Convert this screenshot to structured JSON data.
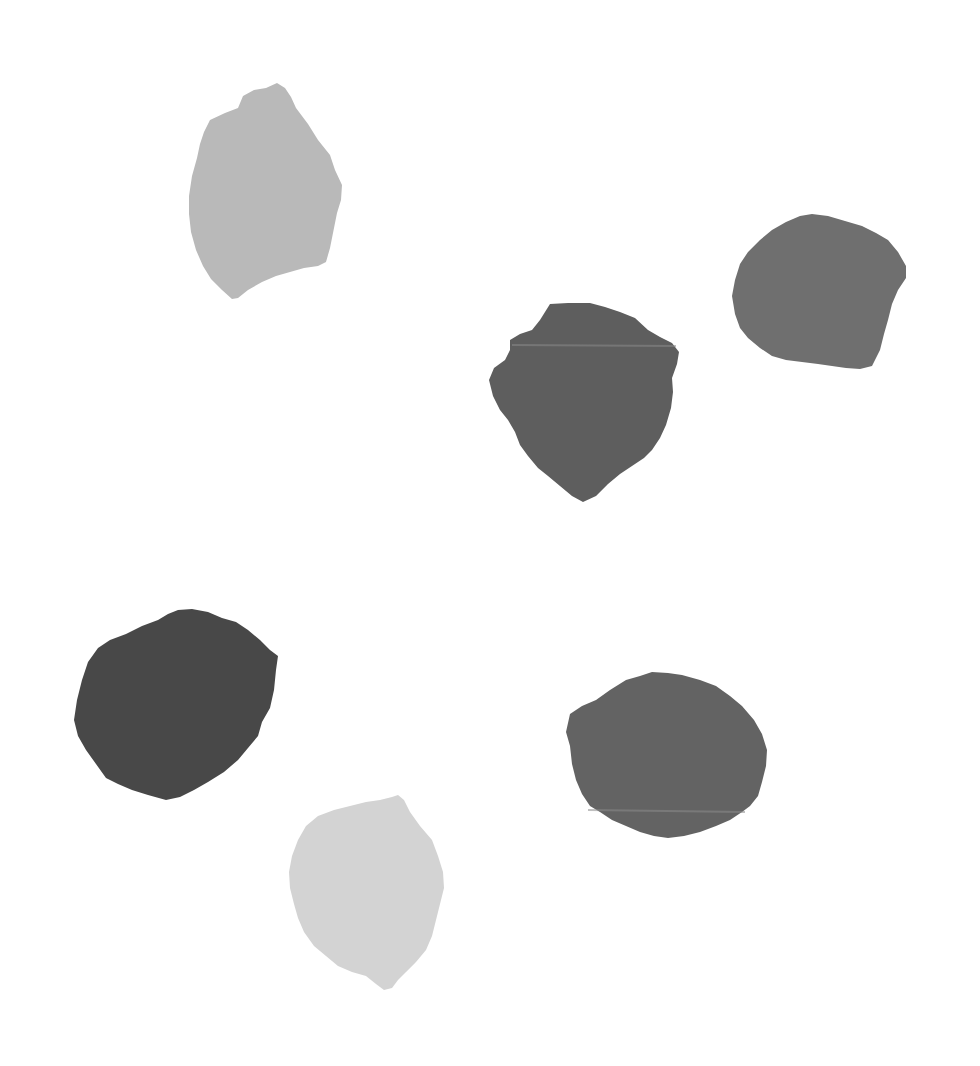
{
  "canvas": {
    "width": 980,
    "height": 1066,
    "background": "#ffffff"
  },
  "swatches": [
    {
      "id": "swatch-1",
      "tone": "light-gray",
      "color": "#b9b9b9",
      "points": "277,83 285,88 291,97 296,108 308,124 318,140 330,155 335,170 342,185 341,200 337,213 334,228 330,248 326,262 318,266 304,268 290,272 276,276 262,282 248,290 238,298 232,299 222,290 211,279 203,266 196,250 191,232 189,214 189,196 192,176 197,158 200,144 204,132 210,120 225,113 238,108 243,96 254,90 266,88"
    },
    {
      "id": "swatch-2",
      "tone": "dark-gray",
      "color": "#5e5e5e",
      "points": "550,304 568,303 590,303 605,307 620,312 635,318 648,330 660,337 672,343 679,352 677,364 672,378 673,392 671,408 666,425 660,438 652,450 644,458 632,466 620,474 608,484 596,496 583,502 572,496 560,486 548,476 538,468 528,456 520,445 515,432 508,420 500,410 493,396 489,380 494,368 505,360 510,350 510,340 520,334 532,330 540,320"
    },
    {
      "id": "swatch-3",
      "tone": "medium-gray",
      "color": "#6f6f6f",
      "points": "800,216 812,214 828,216 845,221 862,226 876,233 888,240 898,252 906,266 906,278 898,290 892,304 888,320 884,334 880,350 872,366 860,369 846,368 832,366 818,364 802,362 786,360 772,356 760,348 748,338 740,328 735,314 732,296 735,280 740,264 748,252 760,240 772,230 786,222"
    },
    {
      "id": "swatch-4",
      "tone": "charcoal",
      "color": "#484848",
      "points": "178,610 192,609 208,612 222,618 236,622 248,630 260,640 270,650 278,656 276,670 274,690 270,708 262,722 258,736 248,748 238,760 224,772 208,782 194,790 180,797 166,800 148,795 132,790 118,784 106,778 96,764 86,750 78,736 74,720 77,700 82,680 88,662 98,648 110,640 126,634 142,626 158,620 168,614"
    },
    {
      "id": "swatch-5",
      "tone": "dark-gray",
      "color": "#636363",
      "points": "652,672 668,673 682,675 700,680 716,686 730,696 742,706 754,720 762,734 767,750 766,766 762,782 758,796 750,806 742,812 730,820 716,826 700,832 684,836 668,838 654,836 640,832 626,826 612,820 600,812 590,806 582,794 576,780 572,764 570,746 566,732 570,714 582,706 596,700 610,690 626,680 640,676"
    },
    {
      "id": "swatch-6",
      "tone": "pale-gray",
      "color": "#d3d3d3",
      "points": "392,797 398,795 404,800 410,812 420,826 432,840 438,856 443,872 444,888 440,904 436,920 432,936 426,950 416,962 406,972 398,980 392,988 384,990 376,984 366,976 352,972 338,966 326,956 314,946 304,932 298,918 294,904 290,888 289,872 292,856 298,840 306,826 318,816 334,810 350,806 366,802 380,800"
    }
  ],
  "tear_lines": [
    {
      "id": "tear-line-swatch-2",
      "color": "#8a8a8a",
      "x1": 512,
      "y1": 345,
      "x2": 676,
      "y2": 346
    },
    {
      "id": "tear-line-swatch-5",
      "color": "#8c8c8c",
      "x1": 588,
      "y1": 810,
      "x2": 745,
      "y2": 812
    }
  ]
}
